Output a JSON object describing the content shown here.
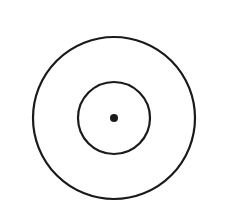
{
  "diagram": {
    "type": "concentric-circles",
    "background": "#ffffff",
    "stroke_color": "#1a1a1a",
    "center": {
      "x": 114,
      "y": 118
    },
    "outer_circle": {
      "r": 81,
      "stroke_width": 2.2
    },
    "inner_circle": {
      "r": 36,
      "stroke_width": 2.2
    },
    "center_dot": {
      "r": 4
    }
  }
}
